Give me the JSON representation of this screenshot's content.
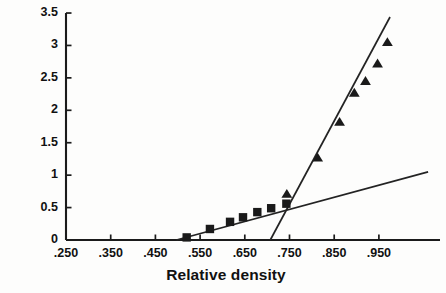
{
  "chart_data": {
    "type": "scatter",
    "title": "",
    "xlabel": "Relative density",
    "ylabel": "Tensile strength [MPa]",
    "xlim": [
      0.25,
      0.99
    ],
    "ylim": [
      0,
      3.5
    ],
    "grid": false,
    "legend_position": "none",
    "xticks": [
      ".250",
      ".350",
      ".450",
      ".550",
      ".650",
      ".750",
      ".850",
      ".950"
    ],
    "xtick_values": [
      0.25,
      0.35,
      0.45,
      0.55,
      0.65,
      0.75,
      0.85,
      0.95
    ],
    "yticks": [
      "0",
      "0.5",
      "1",
      "1.5",
      "2",
      "2.5",
      "3",
      "3.5"
    ],
    "ytick_values": [
      0,
      0.5,
      1,
      1.5,
      2,
      2.5,
      3,
      3.5
    ],
    "series": [
      {
        "name": "low-density branch",
        "marker": "square",
        "color": "#1a1a1a",
        "points": [
          {
            "x": 0.52,
            "y": 0.04
          },
          {
            "x": 0.572,
            "y": 0.17
          },
          {
            "x": 0.617,
            "y": 0.28
          },
          {
            "x": 0.646,
            "y": 0.35
          },
          {
            "x": 0.678,
            "y": 0.43
          },
          {
            "x": 0.709,
            "y": 0.49
          },
          {
            "x": 0.743,
            "y": 0.56
          }
        ]
      },
      {
        "name": "high-density branch",
        "marker": "triangle",
        "color": "#1a1a1a",
        "points": [
          {
            "x": 0.744,
            "y": 0.71
          },
          {
            "x": 0.813,
            "y": 1.27
          },
          {
            "x": 0.862,
            "y": 1.82
          },
          {
            "x": 0.895,
            "y": 2.27
          },
          {
            "x": 0.92,
            "y": 2.45
          },
          {
            "x": 0.947,
            "y": 2.72
          },
          {
            "x": 0.969,
            "y": 3.05
          }
        ]
      }
    ],
    "fit_lines": [
      {
        "name": "shallow-fit-line",
        "x0": 0.497,
        "y0": 0.0,
        "x1": 1.06,
        "y1": 1.05
      },
      {
        "name": "steep-fit-line",
        "x0": 0.707,
        "y0": 0.0,
        "x1": 0.975,
        "y1": 3.44
      }
    ]
  }
}
